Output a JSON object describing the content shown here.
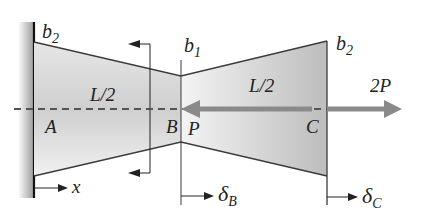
{
  "diagram": {
    "type": "tapered bar, fixed at left wall, axial loads",
    "colors": {
      "bar_fill_light": "#f2f2f2",
      "bar_fill_dark": "#b9b9b9",
      "outline": "#3a3a3a",
      "wall": "#9a9a9a",
      "load_arrow": "#8a8a8a",
      "axis_dash": "#555555"
    },
    "labels": {
      "b2_left": "b",
      "b2_left_sub": "2",
      "b1": "b",
      "b1_sub": "1",
      "b2_right": "b",
      "b2_right_sub": "2",
      "L2_left": "L/2",
      "L2_right": "L/2",
      "A": "A",
      "B": "B",
      "C": "C",
      "P": "P",
      "load_2P": "2P",
      "x": "x",
      "deltaB": "δ",
      "deltaB_sub": "B",
      "deltaC": "δ",
      "deltaC_sub": "C"
    },
    "loads": [
      {
        "name": "P",
        "at": "B",
        "direction": "left"
      },
      {
        "name": "2P",
        "at": "C",
        "direction": "right"
      }
    ],
    "points": [
      "A",
      "B",
      "C"
    ],
    "segments": [
      {
        "from": "A",
        "to": "B",
        "length": "L/2",
        "width_start": "b2",
        "width_end": "b1"
      },
      {
        "from": "B",
        "to": "C",
        "length": "L/2",
        "width_start": "b1",
        "width_end": "b2"
      }
    ]
  }
}
